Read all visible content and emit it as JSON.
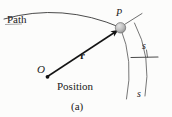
{
  "figure": {
    "caption": "(a)",
    "background_color": "#fcfcfb",
    "ink_color": "#1a1a1a",
    "labels": {
      "path": "Path",
      "position": "Position",
      "origin": "O",
      "point": "P",
      "vector": "r",
      "arc_upper": "s",
      "arc_lower": "s"
    },
    "geometry": {
      "origin_point": [
        47,
        77
      ],
      "particle_point": [
        120,
        28
      ],
      "vector_from": [
        47,
        77
      ],
      "vector_to": [
        120,
        28
      ],
      "particle_radius": 5,
      "particle_fill": "#b9b9b9",
      "path_curve": "M4,19 Q62,2 120,28",
      "arc_inner": "M120,28 Q133,62 126,98",
      "arc_outer": "M133,24 Q150,58 144,96",
      "tangent_tick": [
        [
          124,
          24
        ],
        [
          141,
          14
        ]
      ],
      "cross_tick": [
        [
          131,
          58
        ],
        [
          157,
          57
        ]
      ]
    }
  }
}
